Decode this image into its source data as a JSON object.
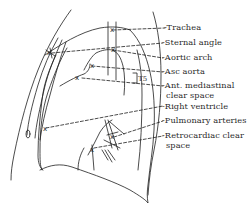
{
  "diagram": {
    "type": "anatomical-line-drawing",
    "stroke_color": "#1e1e1e",
    "background_color": "#ffffff",
    "marker_symbol": "x",
    "bracket_label": "T5",
    "labels": [
      {
        "id": "trachea",
        "text": "-Trachea"
      },
      {
        "id": "sternal-angle",
        "text": "-Sternal angle"
      },
      {
        "id": "aortic-arch",
        "text": "-Aortic arch"
      },
      {
        "id": "asc-aorta",
        "text": "-Asc aorta"
      },
      {
        "id": "ant-mediastinal-1",
        "text": "-Ant. mediastinal"
      },
      {
        "id": "ant-mediastinal-2",
        "text": "clear space"
      },
      {
        "id": "right-ventricle",
        "text": "-Right ventricle"
      },
      {
        "id": "pulmonary-arteries",
        "text": "-Pulmonary arteries"
      },
      {
        "id": "retrocardiac-1",
        "text": "-Retrocardiac clear"
      },
      {
        "id": "retrocardiac-2",
        "text": "space"
      }
    ]
  }
}
